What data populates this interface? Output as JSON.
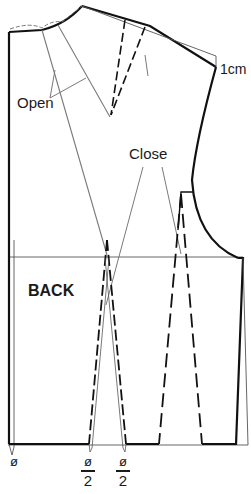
{
  "diagram": {
    "colors": {
      "pattern_line": "#111111",
      "guide_line": "#7a7a7a",
      "text": "#1a1a1a",
      "background": "#ffffff"
    },
    "labels": {
      "open": "Open",
      "close": "Close",
      "shoulder_offset": "1cm",
      "piece_name": "BACK"
    },
    "symbols": {
      "center_back": "ø",
      "dart_left_num": "ø",
      "dart_left_den": "2",
      "dart_right_num": "ø",
      "dart_right_den": "2"
    }
  }
}
